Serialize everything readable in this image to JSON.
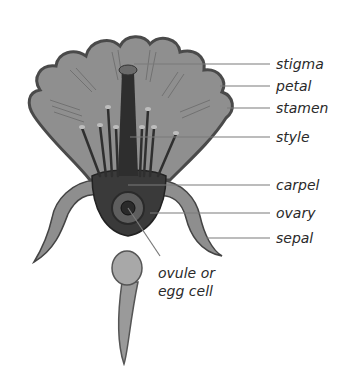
{
  "labels": {
    "stigma": "stigma",
    "petal": "petal",
    "stamen": "stamen",
    "style": "style",
    "carpel": "carpel",
    "ovary": "ovary",
    "sepal": "sepal",
    "ovule_line1": "ovule or",
    "ovule_line2": "egg cell"
  },
  "colors": {
    "petal_fill": "#8f8f8f",
    "petal_outline": "#4a4a4a",
    "carpel_dark": "#2e2e2e",
    "leader_line": "#7a7a7a",
    "label_text": "#2a2a2a"
  }
}
